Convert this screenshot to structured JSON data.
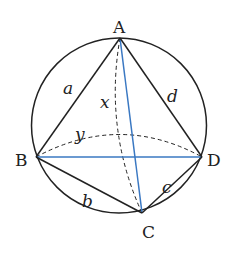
{
  "diagram": {
    "type": "geometry",
    "points": {
      "A": {
        "label": "A",
        "x": 120,
        "y": 38
      },
      "B": {
        "label": "B",
        "x": 36,
        "y": 157
      },
      "C": {
        "label": "C",
        "x": 142,
        "y": 213
      },
      "D": {
        "label": "D",
        "x": 202,
        "y": 157
      }
    },
    "circle": {
      "cx": 119,
      "cy": 125.5,
      "r": 87.5
    },
    "sides": {
      "a": {
        "label": "a",
        "from": "A",
        "to": "B"
      },
      "b": {
        "label": "b",
        "from": "B",
        "to": "C"
      },
      "c": {
        "label": "c",
        "from": "C",
        "to": "D"
      },
      "d": {
        "label": "d",
        "from": "D",
        "to": "A"
      }
    },
    "diagonals": {
      "x": {
        "label": "x",
        "from": "A",
        "to": "C",
        "style": "dashed-arc"
      },
      "y": {
        "label": "y",
        "from": "B",
        "to": "D",
        "style": "dashed-arc"
      }
    },
    "colors": {
      "stroke": "#222222",
      "diagonal": "#3a78c2",
      "background": "#ffffff"
    }
  }
}
